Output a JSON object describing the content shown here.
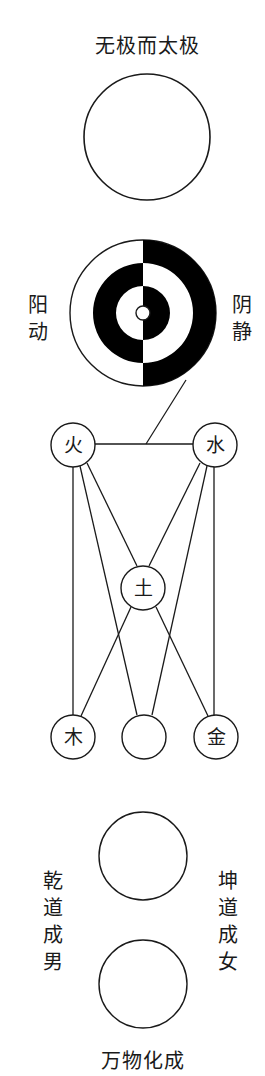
{
  "title": "无极而太极",
  "taiji": {
    "left_label": "阳动",
    "right_label": "阴静"
  },
  "five_elements": {
    "fire": "火",
    "water": "水",
    "earth": "土",
    "wood": "木",
    "metal": "金",
    "middle_bottom": ""
  },
  "lower": {
    "left_label": "乾道成男",
    "right_label": "坤道成女",
    "bottom_caption": "万物化成"
  },
  "colors": {
    "stroke": "#1a1a1a",
    "fill_dark": "#000000",
    "background": "#ffffff"
  }
}
